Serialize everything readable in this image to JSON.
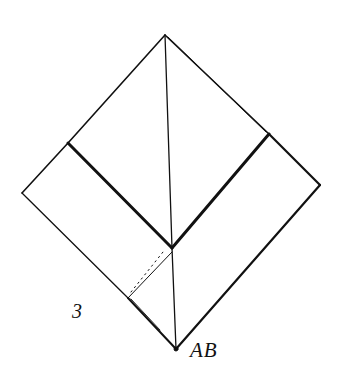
{
  "figure": {
    "step_number": "3",
    "point_label": "AB"
  },
  "colors": {
    "ink": "#111111",
    "background": "#ffffff"
  }
}
